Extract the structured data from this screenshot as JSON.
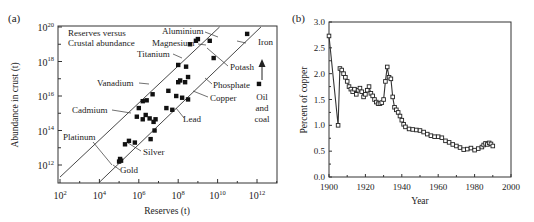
{
  "chart_data": [
    {
      "id": "a",
      "panel_label": "(a)",
      "type": "scatter",
      "title": "",
      "annotation": "Reserves versus Crustal abundance",
      "xlabel": "Reserves (t)",
      "ylabel": "Abundance in crust (t)",
      "x_scale": "log",
      "y_scale": "log",
      "xlim_exp": [
        2,
        13
      ],
      "ylim_exp": [
        11,
        20
      ],
      "x_ticks": [
        {
          "exp": 2,
          "base": "10",
          "sup": "2"
        },
        {
          "exp": 4,
          "base": "10",
          "sup": "4"
        },
        {
          "exp": 6,
          "base": "10",
          "sup": "6"
        },
        {
          "exp": 8,
          "base": "10",
          "sup": "8"
        },
        {
          "exp": 10,
          "base": "10",
          "sup": "10"
        },
        {
          "exp": 12,
          "base": "10",
          "sup": "12"
        }
      ],
      "y_ticks": [
        {
          "exp": 12,
          "base": "10",
          "sup": "12"
        },
        {
          "exp": 14,
          "base": "10",
          "sup": "14"
        },
        {
          "exp": 16,
          "base": "10",
          "sup": "16"
        },
        {
          "exp": 18,
          "base": "10",
          "sup": "18"
        },
        {
          "exp": 20,
          "base": "10",
          "sup": "20"
        }
      ],
      "reference_lines": [
        {
          "name": "upper diagonal",
          "from_exp": [
            2,
            11.3
          ],
          "to_exp": [
            10.1,
            20
          ]
        },
        {
          "name": "lower diagonal",
          "from_exp": [
            4.0,
            11.0
          ],
          "to_exp": [
            12.2,
            20
          ]
        }
      ],
      "points_log10": [
        {
          "x": 5.0,
          "y": 12.2
        },
        {
          "x": 5.05,
          "y": 12.35
        },
        {
          "x": 5.1,
          "y": 12.25
        },
        {
          "x": 5.3,
          "y": 13.2
        },
        {
          "x": 5.5,
          "y": 13.4
        },
        {
          "x": 5.8,
          "y": 13.3
        },
        {
          "x": 5.9,
          "y": 14.8
        },
        {
          "x": 6.2,
          "y": 14.65
        },
        {
          "x": 6.35,
          "y": 14.9
        },
        {
          "x": 6.55,
          "y": 14.7
        },
        {
          "x": 6.75,
          "y": 14.5
        },
        {
          "x": 6.85,
          "y": 14.65
        },
        {
          "x": 6.8,
          "y": 14.0
        },
        {
          "x": 6.6,
          "y": 13.5
        },
        {
          "x": 6.0,
          "y": 15.3
        },
        {
          "x": 6.2,
          "y": 15.7
        },
        {
          "x": 6.4,
          "y": 15.75
        },
        {
          "x": 6.7,
          "y": 16.1
        },
        {
          "x": 7.5,
          "y": 16.3
        },
        {
          "x": 7.9,
          "y": 16.0
        },
        {
          "x": 8.2,
          "y": 15.9
        },
        {
          "x": 8.5,
          "y": 15.8
        },
        {
          "x": 8.0,
          "y": 16.8
        },
        {
          "x": 8.1,
          "y": 16.9
        },
        {
          "x": 8.35,
          "y": 16.8
        },
        {
          "x": 8.5,
          "y": 17.1
        },
        {
          "x": 7.7,
          "y": 15.2
        },
        {
          "x": 7.4,
          "y": 15.3
        },
        {
          "x": 8.0,
          "y": 17.8
        },
        {
          "x": 8.4,
          "y": 17.7
        },
        {
          "x": 8.6,
          "y": 19.0
        },
        {
          "x": 8.9,
          "y": 19.2
        },
        {
          "x": 9.0,
          "y": 19.3
        },
        {
          "x": 9.6,
          "y": 19.2
        },
        {
          "x": 9.8,
          "y": 18.2
        },
        {
          "x": 11.5,
          "y": 19.6
        },
        {
          "x": 12.1,
          "y": 16.7
        }
      ],
      "labels": [
        {
          "text": "Aluminium"
        },
        {
          "text": "Magnesium"
        },
        {
          "text": "Titanium"
        },
        {
          "text": "Iron"
        },
        {
          "text": "Potash"
        },
        {
          "text": "Vanadium"
        },
        {
          "text": "Phosphate"
        },
        {
          "text": "Copper"
        },
        {
          "text": "Cadmium"
        },
        {
          "text": "Lead"
        },
        {
          "text": "Platinum"
        },
        {
          "text": "Silver"
        },
        {
          "text": "Gold"
        },
        {
          "text": "Oil"
        },
        {
          "text": "and"
        },
        {
          "text": "coal"
        }
      ],
      "grid": false
    },
    {
      "id": "b",
      "panel_label": "(b)",
      "type": "line",
      "title": "",
      "xlabel": "Year",
      "ylabel": "Percent of copper",
      "xlim": [
        1900,
        2000
      ],
      "ylim": [
        0.0,
        3.0
      ],
      "x_ticks": [
        "1900",
        "1920",
        "1940",
        "1960",
        "1980",
        "2000"
      ],
      "y_ticks": [
        "0.0",
        "0.5",
        "1.0",
        "1.5",
        "2.0",
        "2.5",
        "3.0"
      ],
      "grid": false,
      "series": [
        {
          "name": "Copper ore grade",
          "marker": "square",
          "x": [
            1900,
            1905,
            1906,
            1907,
            1908,
            1909,
            1910,
            1911,
            1912,
            1913,
            1914,
            1915,
            1916,
            1917,
            1918,
            1919,
            1920,
            1921,
            1922,
            1923,
            1924,
            1925,
            1926,
            1927,
            1928,
            1929,
            1930,
            1931,
            1932,
            1933,
            1934,
            1935,
            1936,
            1937,
            1938,
            1939,
            1940,
            1941,
            1942,
            1944,
            1946,
            1948,
            1950,
            1952,
            1954,
            1956,
            1958,
            1960,
            1962,
            1964,
            1966,
            1968,
            1970,
            1972,
            1974,
            1976,
            1978,
            1980,
            1982,
            1984,
            1985,
            1986,
            1987,
            1988,
            1989,
            1990
          ],
          "values": [
            2.73,
            1.0,
            2.1,
            2.07,
            2.0,
            1.93,
            1.85,
            1.75,
            1.7,
            1.65,
            1.7,
            1.6,
            1.68,
            1.72,
            1.65,
            1.55,
            1.6,
            1.68,
            1.75,
            1.62,
            1.57,
            1.5,
            1.45,
            1.42,
            1.42,
            1.44,
            1.5,
            1.85,
            2.13,
            1.93,
            1.9,
            1.55,
            1.35,
            1.3,
            1.25,
            1.18,
            1.1,
            1.02,
            0.97,
            0.93,
            0.92,
            0.91,
            0.9,
            0.87,
            0.83,
            0.8,
            0.78,
            0.78,
            0.76,
            0.7,
            0.67,
            0.63,
            0.6,
            0.57,
            0.53,
            0.54,
            0.56,
            0.52,
            0.55,
            0.58,
            0.62,
            0.65,
            0.63,
            0.66,
            0.64,
            0.6
          ]
        }
      ]
    }
  ]
}
